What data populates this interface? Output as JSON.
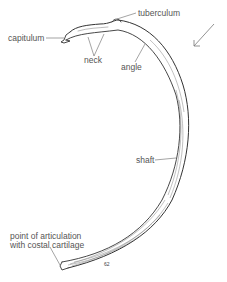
{
  "figure": {
    "labels": {
      "capitulum": "capitulum",
      "tuberculum": "tuberculum",
      "neck": "neck",
      "angle": "angle",
      "shaft": "shaft",
      "articulation_line1": "point of articulation",
      "articulation_line2": "with costal cartilage",
      "plate_number": "62"
    },
    "colors": {
      "ink": "#555555",
      "bone_outline": "#333333",
      "shading": "#777777",
      "background": "#ffffff"
    }
  }
}
